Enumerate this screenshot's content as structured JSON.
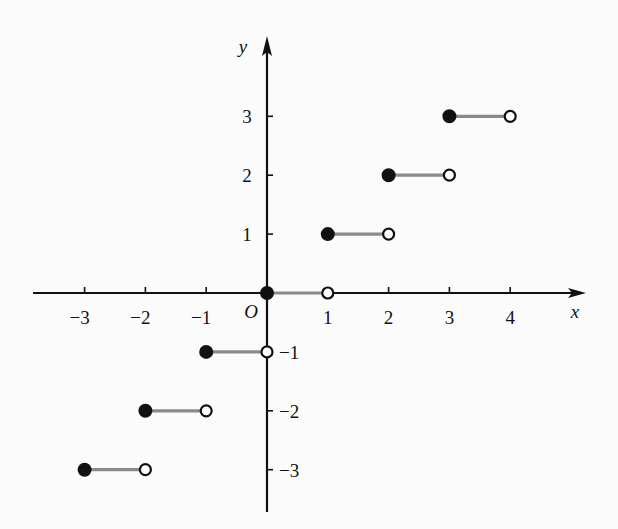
{
  "chart_data": {
    "type": "scatter",
    "title": "",
    "xlabel": "x",
    "ylabel": "y",
    "origin_label": "O",
    "xlim": [
      -3.8,
      5.2
    ],
    "ylim": [
      -3.8,
      4.3
    ],
    "grid": false,
    "x_ticks": [
      -3,
      -2,
      -1,
      1,
      2,
      3,
      4
    ],
    "x_tick_labels": [
      "−3",
      "−2",
      "−1",
      "1",
      "2",
      "3",
      "4"
    ],
    "y_ticks": [
      3,
      2,
      1,
      -1,
      -2,
      -3
    ],
    "y_tick_labels": [
      "3",
      "2",
      "1",
      "−1",
      "−2",
      "−3"
    ],
    "segments": [
      {
        "x_start": -3,
        "x_end": -2,
        "y": -3,
        "start_closed": true,
        "end_closed": false
      },
      {
        "x_start": -2,
        "x_end": -1,
        "y": -2,
        "start_closed": true,
        "end_closed": false
      },
      {
        "x_start": -1,
        "x_end": 0,
        "y": -1,
        "start_closed": true,
        "end_closed": false
      },
      {
        "x_start": 0,
        "x_end": 1,
        "y": 0,
        "start_closed": true,
        "end_closed": false
      },
      {
        "x_start": 1,
        "x_end": 2,
        "y": 1,
        "start_closed": true,
        "end_closed": false
      },
      {
        "x_start": 2,
        "x_end": 3,
        "y": 2,
        "start_closed": true,
        "end_closed": false
      },
      {
        "x_start": 3,
        "x_end": 4,
        "y": 3,
        "start_closed": true,
        "end_closed": false
      }
    ],
    "colors": {
      "axis": "#111111",
      "segment": "#8a8a8a",
      "dot": "#111111",
      "background": "#fbfbfb"
    }
  }
}
